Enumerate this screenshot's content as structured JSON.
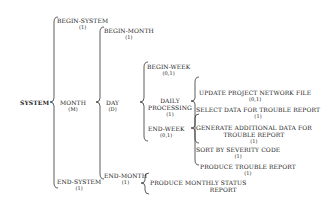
{
  "diagram": {
    "type": "warnier-orr",
    "root": {
      "label": "SYSTEM"
    },
    "level1": [
      {
        "label": "BEGIN-SYSTEM",
        "card": "(1)"
      },
      {
        "label": "MONTH",
        "card": "(M)"
      },
      {
        "label": "END-SYSTEM",
        "card": "(1)"
      }
    ],
    "level2": [
      {
        "label": "BEGIN-MONTH",
        "card": "(1)"
      },
      {
        "label": "DAY",
        "card": "(D)"
      },
      {
        "label": "END-MONTH",
        "card": "(1)"
      }
    ],
    "level3": [
      {
        "label": "BEGIN-WEEK",
        "card": "(0,1)"
      },
      {
        "label1": "DAILY",
        "label2": "PROCESSING",
        "card": "(1)"
      },
      {
        "label": "END-WEEK",
        "card": "(0,1)"
      }
    ],
    "level4": [
      {
        "label": "UPDATE PROJECT NETWORK FILE",
        "card": "(0,1)"
      },
      {
        "label": "SELECT DATA FOR TROUBLE REPORT",
        "card": "(1)"
      },
      {
        "label1": "GENERATE ADDITIONAL DATA FOR",
        "label2": "TROUBLE REPORT",
        "card": "(1)"
      },
      {
        "label": "SORT BY SEVERITY CODE",
        "card": "(1)"
      },
      {
        "label": "PRODUCE TROUBLE REPORT",
        "card": "(1)"
      }
    ],
    "endmonth_child": {
      "label1": "PRODUCE MONTHLY STATUS",
      "label2": "REPORT"
    }
  }
}
